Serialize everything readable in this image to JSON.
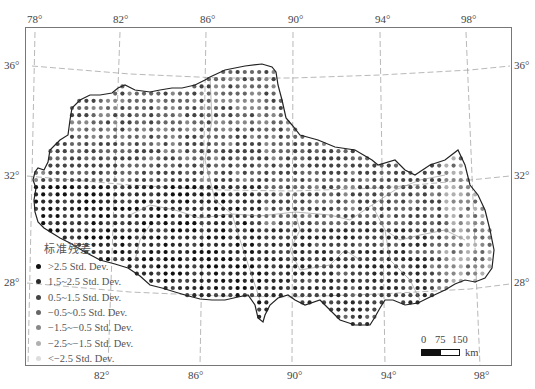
{
  "map": {
    "title": "Tibet standardized residual map",
    "frame": {
      "left": 25,
      "top": 27,
      "right": 512,
      "bottom": 366
    },
    "longitude_labels_top": [
      {
        "text": "78°",
        "x": 27
      },
      {
        "text": "82°",
        "x": 113
      },
      {
        "text": "86°",
        "x": 200
      },
      {
        "text": "90°",
        "x": 288
      },
      {
        "text": "94°",
        "x": 375
      },
      {
        "text": "98°",
        "x": 461
      }
    ],
    "longitude_labels_bottom": [
      {
        "text": "82°",
        "x": 94
      },
      {
        "text": "86°",
        "x": 188
      },
      {
        "text": "90°",
        "x": 287
      },
      {
        "text": "94°",
        "x": 381
      },
      {
        "text": "98°",
        "x": 474
      }
    ],
    "latitude_labels_left": [
      {
        "text": "36°",
        "y": 66
      },
      {
        "text": "32°",
        "y": 176
      },
      {
        "text": "28°",
        "y": 283
      }
    ],
    "latitude_labels_right": [
      {
        "text": "36°",
        "y": 66
      },
      {
        "text": "32°",
        "y": 176
      },
      {
        "text": "28°",
        "y": 283
      }
    ]
  },
  "legend": {
    "title": "标准残差",
    "items": [
      {
        "label": ">2.5 Std. Dev.",
        "color": "#111111"
      },
      {
        "label": "1.5~2.5 Std. Dev.",
        "color": "#2a2a2a"
      },
      {
        "label": "0.5~1.5 Std. Dev.",
        "color": "#444444"
      },
      {
        "label": "−0.5~0.5 Std. Dev.",
        "color": "#666666"
      },
      {
        "label": "−1.5~−0.5 Std. Dev.",
        "color": "#888888"
      },
      {
        "label": "−2.5~−1.5 Std. Dev.",
        "color": "#b0b0b0"
      },
      {
        "label": "<−2.5 Std. Dev.",
        "color": "#dddddd"
      }
    ]
  },
  "scale_bar": {
    "ticks": [
      "0",
      "75",
      "150"
    ],
    "unit": "km"
  }
}
